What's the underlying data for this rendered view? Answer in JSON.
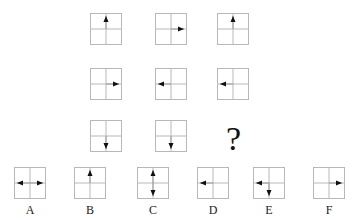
{
  "puzzle": {
    "grid": [
      [
        {
          "arrows": [
            "up"
          ]
        },
        {
          "arrows": [
            "right"
          ]
        },
        {
          "arrows": [
            "up"
          ]
        }
      ],
      [
        {
          "arrows": [
            "right"
          ]
        },
        {
          "arrows": [
            "left"
          ]
        },
        {
          "arrows": [
            "left"
          ]
        }
      ],
      [
        {
          "arrows": [
            "down"
          ]
        },
        {
          "arrows": [
            "down"
          ]
        },
        {
          "missing": true,
          "symbol": "?"
        }
      ]
    ],
    "question_mark": "?",
    "options": [
      {
        "label": "A",
        "arrows": [
          "left",
          "right"
        ]
      },
      {
        "label": "B",
        "arrows": [
          "up"
        ]
      },
      {
        "label": "C",
        "arrows": [
          "up",
          "down"
        ]
      },
      {
        "label": "D",
        "arrows": [
          "left"
        ]
      },
      {
        "label": "E",
        "arrows": [
          "left",
          "down"
        ]
      },
      {
        "label": "F",
        "arrows": [
          "right"
        ]
      }
    ]
  },
  "colors": {
    "grid_line": "#b8b8b8",
    "arrow": "#111111",
    "arrow_line": "#9a9a9a"
  }
}
